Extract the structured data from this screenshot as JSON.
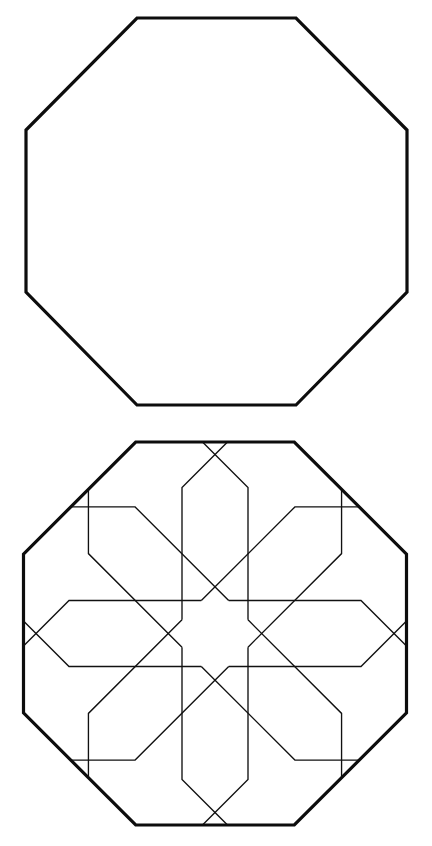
{
  "figure": {
    "panels": [
      {
        "label": "plain-octagon",
        "outline": "137,18 296,18 407,130 407,292 296,405 137,405 26,292 26,130"
      },
      {
        "label": "octagon-with-eight-fold-rosette",
        "outline": "135.68,442 294.32,442 406.5,554.18 406.5,712.82 294.32,825 135.68,825 23.5,712.82 23.5,554.18",
        "pattern_center": [
          215,
          633.5
        ],
        "symmetry": "8-fold rotational",
        "arms": [
          {
            "direction": "N",
            "line_a": "182,619.83 182,487.5 227.5,442",
            "line_b": "248,619.83 248,487.5 202.5,442"
          },
          {
            "direction": "NE",
            "line_a": "201.33,600.5 294.9,506.93 359.25,506.93",
            "line_b": "248,647.17 341.57,553.6 341.57,489.25"
          },
          {
            "direction": "E",
            "line_a": "228.67,600.5 361,600.5 406.5,646",
            "line_b": "228.67,666.5 361,666.5 406.5,621"
          },
          {
            "direction": "SE",
            "line_a": "248,619.83 341.57,713.4 341.57,777.75",
            "line_b": "201.33,666.5 294.9,760.07 359.25,760.07"
          },
          {
            "direction": "S",
            "line_a": "248,647.17 248,779.5 202.5,825",
            "line_b": "182,647.17 182,779.5 227.5,825"
          },
          {
            "direction": "SW",
            "line_a": "228.67,666.5 135.1,760.07 70.75,760.07",
            "line_b": "182,619.83 88.43,713.4 88.43,777.75"
          },
          {
            "direction": "W",
            "line_a": "201.33,666.5 69,666.5 23.5,621",
            "line_b": "201.33,600.5 69,600.5 23.5,646"
          },
          {
            "direction": "NW",
            "line_a": "182,647.17 88.43,553.6 88.43,489.25",
            "line_b": "228.67,600.5 135.1,506.93 70.75,506.93"
          }
        ]
      }
    ],
    "colors": {
      "background": "#ffffff",
      "stroke": "#111111"
    }
  }
}
